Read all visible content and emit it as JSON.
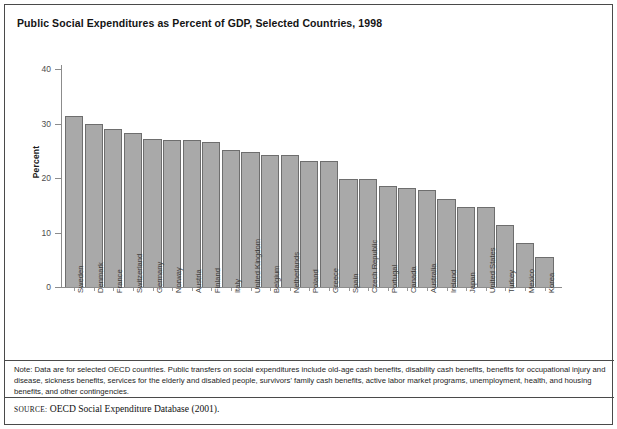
{
  "figure": {
    "title": "Public Social Expenditures as Percent of GDP, Selected Countries, 1998",
    "note": "Note: Data are for selected OECD countries. Public transfers on social expenditures include old-age cash benefits, disability cash benefits, benefits for occupational injury and disease, sickness benefits, services for the elderly and disabled people, survivors' family cash benefits, active labor market programs, unemployment, health, and housing benefits, and other contingencies.",
    "source_kicker": "SOURCE:",
    "source_text": "OECD Social Expenditure Database (2001).",
    "colors": {
      "bar_fill": "#a9a9a9",
      "bar_stroke": "#6e6e6e",
      "axis": "#8c8c8c",
      "frame": "#4a4a4a",
      "text": "#1c1c1c",
      "background": "#ffffff"
    }
  },
  "chart_data": {
    "type": "bar",
    "title": "Public Social Expenditures as Percent of GDP, Selected Countries, 1998",
    "xlabel": "",
    "ylabel": "Percent",
    "ylim": [
      0,
      40
    ],
    "yticks": [
      0,
      10,
      20,
      30,
      40
    ],
    "ytick_labels": [
      "0",
      "10",
      "20",
      "30",
      "40"
    ],
    "grid": false,
    "legend": null,
    "orientation": "vertical",
    "categories": [
      "Sweden",
      "Denmark",
      "France",
      "Switzerland",
      "Germany",
      "Norway",
      "Austria",
      "Finland",
      "Italy",
      "United Kingdom",
      "Belgium",
      "Netherlands",
      "Poland",
      "Greece",
      "Spain",
      "Czech Republic",
      "Portugal",
      "Canada",
      "Australia",
      "Ireland",
      "Japan",
      "United States",
      "Turkey",
      "Mexico",
      "Korea"
    ],
    "values": [
      31.4,
      30.0,
      28.9,
      28.2,
      27.2,
      27.0,
      27.0,
      26.6,
      25.2,
      24.8,
      24.3,
      24.2,
      23.1,
      23.1,
      19.9,
      19.8,
      18.5,
      18.2,
      17.8,
      16.1,
      14.7,
      14.7,
      11.4,
      8.1,
      5.5
    ],
    "value_unit": "percent of GDP"
  }
}
